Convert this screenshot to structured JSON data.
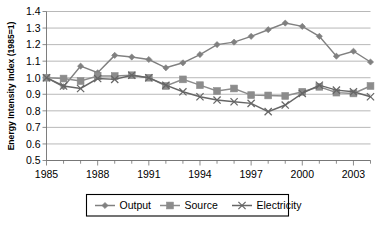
{
  "chart_data": {
    "type": "line",
    "title": "",
    "subtitle": "",
    "xlabel": "",
    "ylabel": "Energy Intensity Index (1985=1)",
    "xlim": [
      1985,
      2004
    ],
    "ylim": [
      0.5,
      1.4
    ],
    "ytick_step": 0.1,
    "grid": true,
    "grid_axis": "y",
    "legend_position": "bottom",
    "x": [
      1985,
      1986,
      1987,
      1988,
      1989,
      1990,
      1991,
      1992,
      1993,
      1994,
      1995,
      1996,
      1997,
      1998,
      1999,
      2000,
      2001,
      2002,
      2003,
      2004
    ],
    "xtick_labels": [
      "1985",
      "1988",
      "1991",
      "1994",
      "1997",
      "2000",
      "2003"
    ],
    "xticks_major": [
      1985,
      1988,
      1991,
      1994,
      1997,
      2000,
      2003
    ],
    "ytick_labels": [
      "0.5",
      "0.6",
      "0.7",
      "0.8",
      "0.9",
      "1.0",
      "1.1",
      "1.2",
      "1.3",
      "1.4"
    ],
    "yticks": [
      0.5,
      0.6,
      0.7,
      0.8,
      0.9,
      1.0,
      1.1,
      1.2,
      1.3,
      1.4
    ],
    "series": [
      {
        "name": "Output",
        "marker": "diamond",
        "color": "#808080",
        "values": [
          1.0,
          0.945,
          1.07,
          1.03,
          1.135,
          1.125,
          1.11,
          1.06,
          1.09,
          1.14,
          1.2,
          1.215,
          1.25,
          1.29,
          1.33,
          1.31,
          1.25,
          1.13,
          1.16,
          1.095
        ]
      },
      {
        "name": "Source",
        "marker": "square",
        "color": "#8c8c8c",
        "values": [
          1.0,
          0.995,
          0.98,
          1.01,
          1.01,
          1.015,
          1.0,
          0.95,
          0.99,
          0.955,
          0.92,
          0.935,
          0.895,
          0.893,
          0.89,
          0.915,
          0.945,
          0.91,
          0.905,
          0.95
        ]
      },
      {
        "name": "Electricity",
        "marker": "x",
        "color": "#666666",
        "values": [
          1.0,
          0.95,
          0.935,
          0.995,
          0.99,
          1.015,
          1.0,
          0.955,
          0.915,
          0.885,
          0.865,
          0.855,
          0.845,
          0.795,
          0.835,
          0.905,
          0.955,
          0.925,
          0.915,
          0.885
        ]
      }
    ],
    "series_last_values": {
      "Output": 1.16,
      "Source": 0.95,
      "Electricity": 0.885
    }
  },
  "legend": {
    "entries": [
      {
        "label": "Output"
      },
      {
        "label": "Source"
      },
      {
        "label": "Electricity"
      }
    ]
  },
  "axes": {
    "y_title": "Energy Intensity Index (1985=1)"
  }
}
